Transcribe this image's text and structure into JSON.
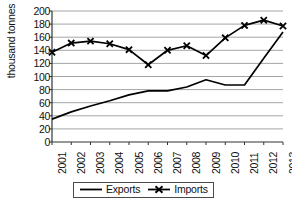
{
  "chart_data": {
    "type": "line",
    "title": "",
    "xlabel": "",
    "ylabel": "thousand tonnes",
    "categories": [
      "2001",
      "2002",
      "2003",
      "2004",
      "2005",
      "2006",
      "2007",
      "2008",
      "2009",
      "2010",
      "2011",
      "2012",
      "2013"
    ],
    "ylim": [
      0,
      200
    ],
    "yticks": [
      0,
      20,
      40,
      60,
      80,
      100,
      120,
      140,
      160,
      180,
      200
    ],
    "grid": true,
    "legend_position": "bottom-center",
    "series": [
      {
        "name": "Exports",
        "marker": "none",
        "color": "#000000",
        "values": [
          35,
          46,
          55,
          63,
          72,
          78,
          78,
          84,
          95,
          87,
          87,
          128,
          168
        ]
      },
      {
        "name": "Imports",
        "marker": "x",
        "color": "#000000",
        "values": [
          137,
          151,
          154,
          150,
          141,
          118,
          140,
          147,
          132,
          159,
          178,
          186,
          177
        ]
      }
    ]
  },
  "legend": {
    "exports_label": "Exports",
    "imports_label": "Imports"
  },
  "axis": {
    "y_title": "thousand tonnes"
  }
}
